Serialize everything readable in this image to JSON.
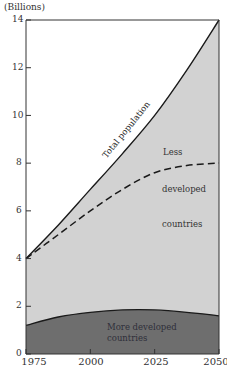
{
  "chart_data": {
    "type": "area",
    "title": "",
    "ylabel": "(Billions)",
    "xlabel": "",
    "x": [
      1975,
      1987.5,
      2000,
      2012.5,
      2025,
      2037.5,
      2050
    ],
    "xticks": [
      "1975",
      "2000",
      "2025",
      "2050"
    ],
    "yticks": [
      "0",
      "2",
      "4",
      "6",
      "8",
      "10",
      "12",
      "14"
    ],
    "ylim": [
      0,
      14
    ],
    "xlim": [
      1975,
      2050
    ],
    "grid": false,
    "series": [
      {
        "name": "Total population",
        "style": "solid line",
        "values": [
          4.0,
          5.4,
          6.9,
          8.4,
          10.0,
          11.9,
          14.0
        ]
      },
      {
        "name": "Less developed countries boundary",
        "style": "dashed line",
        "values": [
          4.0,
          5.0,
          6.0,
          6.9,
          7.6,
          7.9,
          8.0
        ]
      },
      {
        "name": "More developed countries",
        "style": "filled dark area",
        "values": [
          1.2,
          1.55,
          1.75,
          1.85,
          1.85,
          1.75,
          1.6
        ]
      }
    ],
    "annotations": [
      "Total population",
      "Less developed countries",
      "More developed countries"
    ],
    "colors": {
      "less_developed_fill": "#d2d2d2",
      "more_developed_fill": "#6e6e6e",
      "line": "#1a1a1a",
      "background": "#ffffff"
    }
  },
  "labels": {
    "ylabel": "(Billions)",
    "yticks": [
      "0",
      "2",
      "4",
      "6",
      "8",
      "10",
      "12",
      "14"
    ],
    "xticks": [
      "1975",
      "2000",
      "2025",
      "2050"
    ],
    "total_population": "Total population",
    "less_1": "Less",
    "less_2": "developed",
    "less_3": "countries",
    "more_1": "More developed",
    "more_2": "countries"
  }
}
